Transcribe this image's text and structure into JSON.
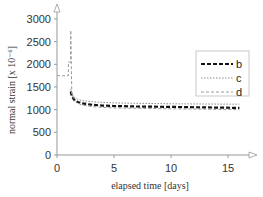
{
  "chart_data": {
    "type": "line",
    "title": "",
    "xlabel": "elapsed time [days]",
    "ylabel": "normal strain [x 10⁻⁶]",
    "xlim": [
      0,
      16.5
    ],
    "ylim": [
      0,
      3000
    ],
    "xticks": [
      0,
      5,
      10,
      15
    ],
    "xtick_labels": [
      "0",
      "5",
      "10",
      "15"
    ],
    "yticks": [
      0,
      500,
      1000,
      1500,
      2000,
      2500,
      3000
    ],
    "ytick_labels": [
      "0",
      "500",
      "1000",
      "1500",
      "2000",
      "2500",
      "3000"
    ],
    "grid": false,
    "legend_position": "upper right",
    "series": [
      {
        "name": "b",
        "style": "dashed-thick",
        "color": "#111111",
        "x": [
          1.2,
          1.3,
          1.5,
          1.8,
          2.2,
          3,
          4,
          5,
          7,
          10,
          13,
          16
        ],
        "y": [
          1400,
          1300,
          1220,
          1170,
          1140,
          1110,
          1090,
          1080,
          1070,
          1060,
          1050,
          1040
        ]
      },
      {
        "name": "c",
        "style": "dotted-thin",
        "color": "#888888",
        "x": [
          1.2,
          1.3,
          1.5,
          1.8,
          2.2,
          3,
          4,
          5,
          7,
          10,
          13,
          16
        ],
        "y": [
          1450,
          1350,
          1270,
          1230,
          1200,
          1175,
          1160,
          1150,
          1140,
          1130,
          1125,
          1120
        ]
      },
      {
        "name": "d",
        "style": "dashed-thin",
        "color": "#999999",
        "x": [
          0,
          0.6,
          0.6,
          1.0,
          1.0,
          1.2,
          1.2,
          1.3,
          1.5,
          1.8,
          2.2,
          3,
          4,
          5,
          7,
          10,
          13,
          16
        ],
        "y": [
          1750,
          1750,
          1750,
          1750,
          2050,
          2050,
          2750,
          1350,
          1230,
          1150,
          1100,
          1070,
          1050,
          1040,
          1030,
          1020,
          1010,
          1000
        ]
      }
    ],
    "annotations": []
  }
}
